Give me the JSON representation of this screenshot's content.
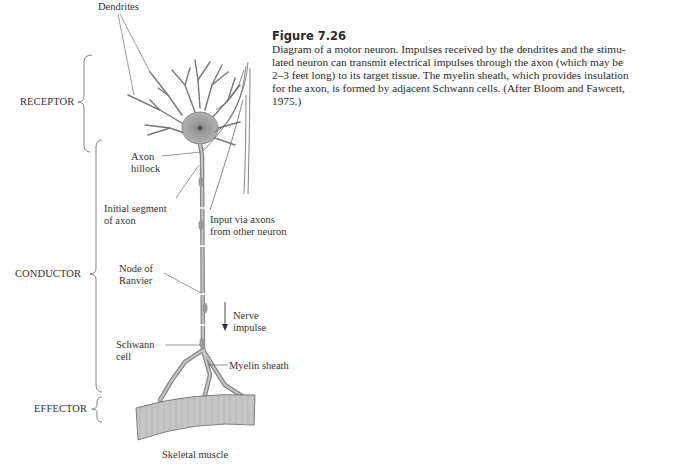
{
  "figure": {
    "number": "Figure 7.26",
    "caption_lines": [
      "Diagram of a motor neuron. Impulses received by the dendrites and the stimu-",
      "lated neuron can transmit electrical impulses through the axon (which may be",
      "2–3 feet long) to its target tissue. The myelin sheath, which provides insulation",
      "for the axon, is formed by adjacent Schwann cells. (After Bloom and Fawcett,",
      "1975.)"
    ]
  },
  "regions": {
    "receptor": "RECEPTOR",
    "conductor": "CONDUCTOR",
    "effector": "EFFECTOR"
  },
  "labels": {
    "dendrites": "Dendrites",
    "axon_hillock_1": "Axon",
    "axon_hillock_2": "hillock",
    "initial_segment_1": "Initial segment",
    "initial_segment_2": "of axon",
    "input_axons_1": "Input via axons",
    "input_axons_2": "from other neuron",
    "node_ranvier_1": "Node of",
    "node_ranvier_2": "Ranvier",
    "nerve_impulse_1": "Nerve",
    "nerve_impulse_2": "impulse",
    "schwann_1": "Schwann",
    "schwann_2": "cell",
    "myelin": "Myelin sheath",
    "muscle": "Skeletal muscle"
  }
}
